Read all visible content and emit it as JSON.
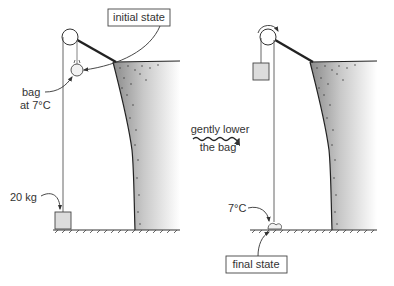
{
  "diagram": {
    "type": "physics-process-illustration",
    "panels": [
      {
        "id": "initial",
        "state_label": "initial state",
        "bag_label_line1": "bag",
        "bag_label_line2": "at 7°C",
        "weight_label": "20 kg"
      },
      {
        "id": "final",
        "state_label": "final state",
        "bag_temp_label": "7°C"
      }
    ],
    "transition": {
      "line1": "gently lower",
      "line2": "the bag"
    },
    "colors": {
      "line": "#333333",
      "rope": "#555555",
      "cliff_dark": "#8a8a8a",
      "cliff_light": "#ffffff",
      "weight_fill": "#dcdcdc"
    }
  }
}
